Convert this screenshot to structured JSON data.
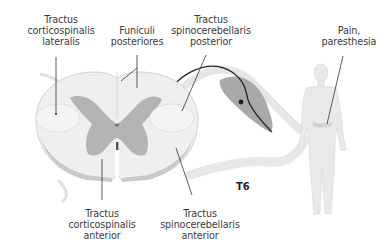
{
  "diagram": {
    "type": "anatomy-illustration",
    "segment_label": "T6",
    "labels": {
      "corticospinal_lateral": [
        "Tractus",
        "corticospinalis",
        "lateralis"
      ],
      "funiculi_posteriores": [
        "Funiculi",
        "posteriores"
      ],
      "spinocerebellar_posterior": [
        "Tractus",
        "spinocerebellaris",
        "posterior"
      ],
      "pain": [
        "Pain,",
        "paresthesia"
      ],
      "corticospinal_anterior": [
        "Tractus",
        "corticospinalis",
        "anterior"
      ],
      "spinocerebellar_anterior": [
        "Tractus",
        "spinocerebellaris",
        "anterior"
      ]
    },
    "colors": {
      "white_matter": "#efefef",
      "grey_matter": "#b4b4b4",
      "outline": "#cfcfcf",
      "leader_line": "#333333",
      "ganglion": "#9a9a9a",
      "figure": "#e6e6e6"
    }
  }
}
